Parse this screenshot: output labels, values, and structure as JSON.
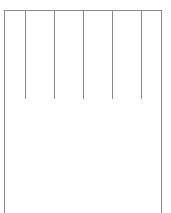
{
  "layout": {
    "columns": 6,
    "divider_positions_px": [
      25,
      54,
      83,
      112,
      141
    ],
    "line_color": "#8a8a8a"
  }
}
